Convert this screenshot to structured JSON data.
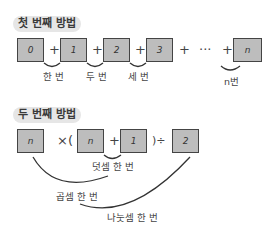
{
  "method1": {
    "title": "첫 번째 방법",
    "boxes": [
      "0",
      "1",
      "2",
      "3",
      "n"
    ],
    "operators": [
      "+",
      "+",
      "+",
      "+",
      "···",
      "+"
    ],
    "labels": [
      "한 번",
      "두 번",
      "세 번",
      "n번"
    ]
  },
  "method2": {
    "title": "두 번째 방법",
    "boxes": [
      "n",
      "n",
      "1",
      "2"
    ],
    "operators": [
      "×(",
      "+",
      ")÷"
    ],
    "labels": {
      "addition": "덧셈 한 번",
      "multiplication": "곱셈 한 번",
      "division": "나눗셈 한 번"
    }
  },
  "colors": {
    "box_fill": "#bdbdbd",
    "box_border": "#444444",
    "title_bg": "#e6e6e6"
  }
}
